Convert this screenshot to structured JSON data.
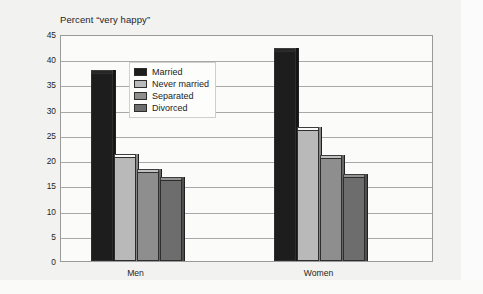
{
  "figure": {
    "axis_title": "Percent “very happy”",
    "legend_position": "inside-top-left"
  },
  "chart_data": {
    "type": "bar",
    "title": "",
    "subtitle": "",
    "xlabel": "",
    "ylabel": "Percent “very happy”",
    "categories": [
      "Men",
      "Women"
    ],
    "series": [
      {
        "name": "Married",
        "values": [
          37.2,
          41.7
        ],
        "color": "#1d1d1d"
      },
      {
        "name": "Never married",
        "values": [
          20.7,
          26.0
        ],
        "color": "#b9b9b9"
      },
      {
        "name": "Separated",
        "values": [
          17.7,
          20.4
        ],
        "color": "#8e8e8e"
      },
      {
        "name": "Divorced",
        "values": [
          16.0,
          16.7
        ],
        "color": "#6d6d6d"
      }
    ],
    "ylim": [
      0,
      45
    ],
    "yticks": [
      0,
      5,
      10,
      15,
      20,
      25,
      30,
      35,
      40,
      45
    ],
    "ytick_labels": [
      "0",
      "5",
      "10",
      "15",
      "20",
      "25",
      "30",
      "35",
      "40",
      "45"
    ],
    "grid": true,
    "grid_axis": "y",
    "legend": [
      "Married",
      "Never married",
      "Separated",
      "Divorced"
    ],
    "legend_position": "upper left inside plot"
  },
  "colors": {
    "married": "#1d1d1d",
    "never_married": "#b9b9b9",
    "separated": "#8e8e8e",
    "divorced": "#6d6d6d",
    "plot_background": "#fbfbfa",
    "gridline": "#a8a8a8",
    "frame": "#9a9a9a",
    "page": "#f2f2f0"
  }
}
